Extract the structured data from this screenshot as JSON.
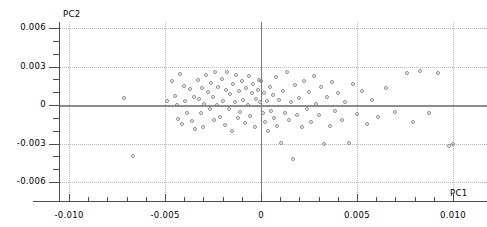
{
  "chart_data": {
    "type": "scatter",
    "title": "",
    "xlabel": "PC1",
    "ylabel": "PC2",
    "xlim": [
      -0.0115,
      0.0108
    ],
    "ylim": [
      -0.0072,
      0.0068
    ],
    "grid": true,
    "legend": "none",
    "marker": "open-circle",
    "marker_color": "#8a8a8a",
    "xticks": [
      -0.01,
      -0.005,
      0,
      0.005,
      0.01
    ],
    "xtick_labels": [
      "-0.010",
      "-0.005",
      "0",
      "0.005",
      "0.010"
    ],
    "yticks": [
      0.006,
      0.003,
      0,
      -0.003,
      -0.006
    ],
    "ytick_labels": [
      "0.006",
      "0.003",
      "0",
      "-0.003",
      "-0.006"
    ],
    "x_minor_ticks": [
      -0.009,
      -0.008,
      -0.007,
      -0.006,
      -0.004,
      -0.003,
      -0.002,
      -0.001,
      0.001,
      0.002,
      0.003,
      0.004,
      0.006,
      0.007,
      0.008,
      0.009
    ],
    "y_minor_ticks": [
      0.005,
      0.004,
      0.002,
      0.001,
      -0.001,
      -0.002,
      -0.004,
      -0.005
    ],
    "vertical_gridlines": [
      -0.01,
      -0.005,
      0.005,
      0.01
    ],
    "horizontal_gridlines": [
      0.006,
      0.003,
      -0.003,
      -0.006
    ],
    "zero_lines": {
      "vertical_x": 0,
      "horizontal_y": 0
    },
    "points": [
      [
        -0.00665,
        -0.00395
      ],
      [
        -0.00715,
        0.00055
      ],
      [
        -0.0049,
        0.0003
      ],
      [
        -0.00465,
        0.0019
      ],
      [
        -0.0045,
        0.0007
      ],
      [
        -0.0044,
        0.0
      ],
      [
        -0.0043,
        -0.0011
      ],
      [
        -0.0042,
        0.00245
      ],
      [
        -0.0041,
        -0.0015
      ],
      [
        -0.004,
        0.0015
      ],
      [
        -0.00395,
        0.0003
      ],
      [
        -0.00385,
        -0.00065
      ],
      [
        -0.0037,
        0.00125
      ],
      [
        -0.0036,
        -0.00125
      ],
      [
        -0.0035,
        0.0006
      ],
      [
        -0.00345,
        -0.0019
      ],
      [
        -0.0033,
        0.00195
      ],
      [
        -0.00325,
        0.00045
      ],
      [
        -0.00315,
        -0.0006
      ],
      [
        -0.00305,
        0.0013
      ],
      [
        -0.003,
        -0.00175
      ],
      [
        -0.00295,
        5e-05
      ],
      [
        -0.00285,
        0.0023
      ],
      [
        -0.00275,
        0.001
      ],
      [
        -0.00268,
        -0.00035
      ],
      [
        -0.0026,
        0.00175
      ],
      [
        -0.0025,
        0.0006
      ],
      [
        -0.00245,
        -0.0012
      ],
      [
        -0.00238,
        0.00255
      ],
      [
        -0.0023,
        0.0
      ],
      [
        -0.00222,
        0.0014
      ],
      [
        -0.00215,
        -0.0009
      ],
      [
        -0.00205,
        0.00205
      ],
      [
        -0.00198,
        0.00035
      ],
      [
        -0.0019,
        -0.00155
      ],
      [
        -0.00182,
        0.0012
      ],
      [
        -0.00175,
        0.00255
      ],
      [
        -0.00168,
        -0.0003
      ],
      [
        -0.0016,
        0.00085
      ],
      [
        -0.00152,
        -0.00205
      ],
      [
        -0.00145,
        0.0016
      ],
      [
        -0.00138,
        0.0002
      ],
      [
        -0.0013,
        0.0023
      ],
      [
        -0.00122,
        -0.001
      ],
      [
        -0.00115,
        0.0011
      ],
      [
        -0.00108,
        -0.00055
      ],
      [
        -0.001,
        0.0019
      ],
      [
        -0.00092,
        0.0004
      ],
      [
        -0.00085,
        -0.0014
      ],
      [
        -0.00078,
        0.00135
      ],
      [
        -0.0007,
        0.0
      ],
      [
        -0.00062,
        0.00225
      ],
      [
        -0.00055,
        -0.00085
      ],
      [
        -0.00048,
        0.00095
      ],
      [
        -0.0004,
        0.0016
      ],
      [
        -0.00032,
        -0.00175
      ],
      [
        -0.00025,
        0.0005
      ],
      [
        -0.00018,
        0.0012
      ],
      [
        -0.0001,
        0.00195
      ],
      [
        -6e-05,
        0.0002
      ],
      [
        -2e-05,
        0.0019
      ],
      [
        2e-05,
        0.00185
      ],
      [
        8e-05,
        -0.0006
      ],
      [
        0.00015,
        0.00095
      ],
      [
        0.00022,
        -0.0013
      ],
      [
        0.0003,
        0.0003
      ],
      [
        0.00038,
        -0.002
      ],
      [
        0.00045,
        0.0014
      ],
      [
        0.00052,
        -0.0005
      ],
      [
        0.0006,
        0.00075
      ],
      [
        0.0007,
        -0.001
      ],
      [
        0.00078,
        0.00215
      ],
      [
        0.00085,
        -0.0016
      ],
      [
        0.00095,
        0.0004
      ],
      [
        0.00105,
        -0.00295
      ],
      [
        0.00115,
        0.0011
      ],
      [
        0.00125,
        -0.00065
      ],
      [
        0.00135,
        0.0026
      ],
      [
        0.00145,
        -0.0012
      ],
      [
        0.00155,
        0.00025
      ],
      [
        0.00165,
        -0.0042
      ],
      [
        0.00178,
        0.00155
      ],
      [
        0.0019,
        -0.0008
      ],
      [
        0.002,
        0.00055
      ],
      [
        0.00212,
        -0.00175
      ],
      [
        0.00225,
        0.0019
      ],
      [
        0.00238,
        -0.00035
      ],
      [
        0.0025,
        0.00105
      ],
      [
        0.00262,
        -0.0013
      ],
      [
        0.00275,
        0.00225
      ],
      [
        0.00288,
        0.0001
      ],
      [
        0.003,
        -0.00075
      ],
      [
        0.00315,
        0.0014
      ],
      [
        0.0033,
        -0.003
      ],
      [
        0.00345,
        0.0006
      ],
      [
        0.00358,
        -0.0016
      ],
      [
        0.00372,
        0.0018
      ],
      [
        0.00385,
        -0.00045
      ],
      [
        0.004,
        0.0009
      ],
      [
        0.0042,
        -0.00115
      ],
      [
        0.0044,
        0.0002
      ],
      [
        0.0046,
        -0.00295
      ],
      [
        0.0048,
        0.0016
      ],
      [
        0.005,
        -0.0007
      ],
      [
        0.00525,
        0.0011
      ],
      [
        0.0055,
        -0.0015
      ],
      [
        0.0058,
        0.0004
      ],
      [
        0.0061,
        -0.0009
      ],
      [
        0.0065,
        0.00135
      ],
      [
        0.007,
        -0.00055
      ],
      [
        0.0076,
        0.0025
      ],
      [
        0.0079,
        -0.0013
      ],
      [
        0.0083,
        0.00265
      ],
      [
        0.00875,
        -0.00065
      ],
      [
        0.0092,
        0.0025
      ],
      [
        0.0098,
        -0.0032
      ],
      [
        0.01,
        -0.003
      ]
    ]
  }
}
